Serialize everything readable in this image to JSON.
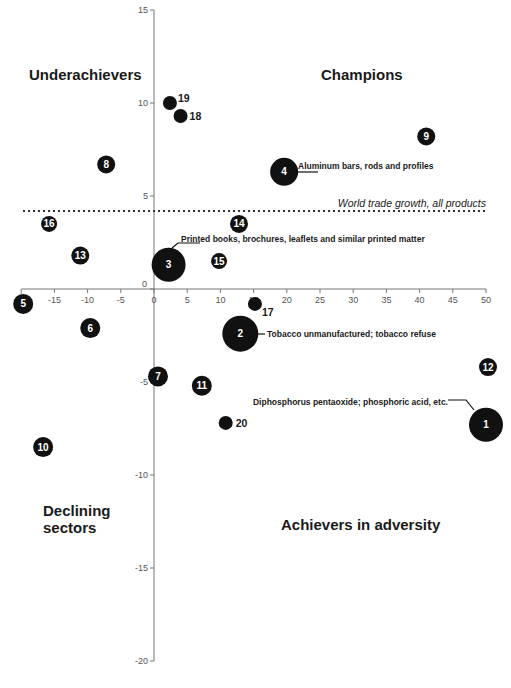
{
  "chart_data": {
    "type": "scatter",
    "subtype": "bubble",
    "title": "",
    "xlabel": "",
    "ylabel": "",
    "xlim": [
      -20,
      50
    ],
    "ylim": [
      -20,
      15
    ],
    "x_ticks": [
      -15,
      -10,
      -5,
      0,
      5,
      10,
      15,
      20,
      25,
      30,
      35,
      40,
      45,
      50
    ],
    "y_ticks": [
      15,
      10,
      5,
      0,
      -5,
      -10,
      -15,
      -20
    ],
    "grid": false,
    "reference_line": {
      "y": 4.2,
      "label": "World trade growth, all products",
      "style": "dotted"
    },
    "quadrant_labels": {
      "top_left": "Underachievers",
      "top_right": "Champions",
      "bottom_left": "Declining sectors",
      "bottom_right": "Achievers in adversity"
    },
    "points": [
      {
        "id": "1",
        "x": 50.0,
        "y": -7.3,
        "size": 17,
        "label_inside": true,
        "annotation": "Diphosphorus pentaoxide; phosphoric acid, etc."
      },
      {
        "id": "2",
        "x": 13.0,
        "y": -2.4,
        "size": 18,
        "label_inside": true,
        "annotation": "Tobacco unmanufactured; tobacco refuse"
      },
      {
        "id": "3",
        "x": 2.2,
        "y": 1.3,
        "size": 17,
        "label_inside": true,
        "annotation": "Printed books, brochures, leaflets and similar printed matter"
      },
      {
        "id": "4",
        "x": 19.6,
        "y": 6.3,
        "size": 14,
        "label_inside": true,
        "annotation": "Aluminum bars, rods and profiles"
      },
      {
        "id": "5",
        "x": -19.7,
        "y": -0.8,
        "size": 10,
        "label_inside": true
      },
      {
        "id": "6",
        "x": -9.6,
        "y": -2.1,
        "size": 10,
        "label_inside": true
      },
      {
        "id": "7",
        "x": 0.6,
        "y": -4.7,
        "size": 10,
        "label_inside": true
      },
      {
        "id": "8",
        "x": -7.2,
        "y": 6.7,
        "size": 9,
        "label_inside": true
      },
      {
        "id": "9",
        "x": 41.0,
        "y": 8.2,
        "size": 9,
        "label_inside": true
      },
      {
        "id": "10",
        "x": -16.7,
        "y": -8.5,
        "size": 10,
        "label_inside": true
      },
      {
        "id": "11",
        "x": 7.2,
        "y": -5.2,
        "size": 10,
        "label_inside": true
      },
      {
        "id": "12",
        "x": 50.3,
        "y": -4.2,
        "size": 9,
        "label_inside": true
      },
      {
        "id": "13",
        "x": -11.1,
        "y": 1.8,
        "size": 9,
        "label_inside": true
      },
      {
        "id": "14",
        "x": 12.8,
        "y": 3.5,
        "size": 9,
        "label_inside": true
      },
      {
        "id": "15",
        "x": 9.8,
        "y": 1.5,
        "size": 8,
        "label_inside": true
      },
      {
        "id": "16",
        "x": -15.8,
        "y": 3.5,
        "size": 8,
        "label_inside": true
      },
      {
        "id": "17",
        "x": 15.2,
        "y": -0.8,
        "size": 7,
        "label_inside": false
      },
      {
        "id": "18",
        "x": 4.0,
        "y": 9.3,
        "size": 7,
        "label_inside": false
      },
      {
        "id": "19",
        "x": 2.4,
        "y": 10.0,
        "size": 7,
        "label_inside": false
      },
      {
        "id": "20",
        "x": 10.8,
        "y": -7.2,
        "size": 7,
        "label_inside": false
      }
    ]
  },
  "colors": {
    "bubble": "#111111",
    "axis": "#777777",
    "text": "#1a1a1a",
    "tick_text": "#555555"
  }
}
